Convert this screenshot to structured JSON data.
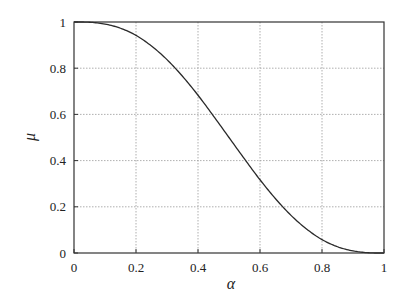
{
  "chart_data": {
    "type": "line",
    "title": "",
    "xlabel": "α",
    "ylabel": "μ",
    "xlim": [
      0,
      1
    ],
    "ylim": [
      0,
      1
    ],
    "grid": true,
    "legend": null,
    "x_ticks": [
      "0",
      "0.2",
      "0.4",
      "0.6",
      "0.8",
      "1"
    ],
    "y_ticks": [
      "0",
      "0.2",
      "0.4",
      "0.6",
      "0.8",
      "1"
    ],
    "series": [
      {
        "name": "μ(α)",
        "x": [
          0,
          0.05,
          0.1,
          0.15,
          0.2,
          0.25,
          0.3,
          0.35,
          0.4,
          0.45,
          0.5,
          0.55,
          0.6,
          0.65,
          0.7,
          0.75,
          0.8,
          0.85,
          0.9,
          0.95,
          1
        ],
        "y": [
          1.0,
          0.999,
          0.991,
          0.973,
          0.942,
          0.896,
          0.837,
          0.765,
          0.683,
          0.593,
          0.5,
          0.407,
          0.317,
          0.235,
          0.163,
          0.104,
          0.058,
          0.027,
          0.009,
          0.001,
          0.0
        ]
      }
    ]
  },
  "plot": {
    "left": 74,
    "right": 384,
    "top": 22,
    "bottom": 253,
    "colors": {
      "curve": "#2a2a2a",
      "grid": "#9a9a9a",
      "frame": "#333333"
    }
  }
}
